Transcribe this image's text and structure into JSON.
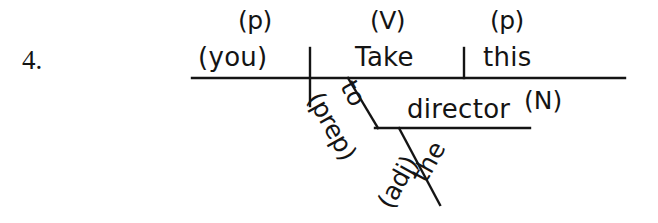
{
  "exercise": {
    "number": "4."
  },
  "diagram": {
    "type": "sentence-diagram",
    "sentence": "Take this to the director",
    "ink_color": "#141414",
    "background_color": "#ffffff",
    "nodes": [
      {
        "id": "subject",
        "word": "(you)",
        "pos_tag": "(p)",
        "tag_position": "above"
      },
      {
        "id": "verb",
        "word": "Take",
        "pos_tag": "(V)",
        "tag_position": "above"
      },
      {
        "id": "object",
        "word": "this",
        "pos_tag": "(p)",
        "tag_position": "above"
      },
      {
        "id": "prep",
        "word": "to",
        "pos_tag": "(prep)",
        "tag_position": "below-slanted"
      },
      {
        "id": "obj-prep",
        "word": "director",
        "pos_tag": "(N)",
        "tag_position": "superscript"
      },
      {
        "id": "adj",
        "word": "the",
        "pos_tag": "(adj)",
        "tag_position": "below-slanted"
      }
    ],
    "lines": [
      {
        "id": "main-baseline",
        "kind": "horizontal",
        "x1": 192,
        "y1": 78,
        "x2": 625,
        "y2": 78
      },
      {
        "id": "subject-divider",
        "kind": "vertical",
        "x1": 310,
        "y1": 48,
        "x2": 310,
        "y2": 106
      },
      {
        "id": "object-divider",
        "kind": "vertical",
        "x1": 464,
        "y1": 48,
        "x2": 464,
        "y2": 78
      },
      {
        "id": "prep-slant",
        "kind": "diagonal",
        "x1": 348,
        "y1": 78,
        "x2": 378,
        "y2": 128
      },
      {
        "id": "obj-prep-line",
        "kind": "horizontal",
        "x1": 375,
        "y1": 128,
        "x2": 530,
        "y2": 128
      },
      {
        "id": "adj-slant",
        "kind": "diagonal",
        "x1": 399,
        "y1": 128,
        "x2": 440,
        "y2": 205
      }
    ]
  }
}
